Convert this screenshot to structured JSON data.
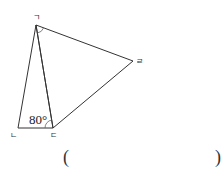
{
  "figure": {
    "vertices": {
      "giyeok": {
        "label": "ㄱ",
        "x": 36,
        "y": 25
      },
      "nieun": {
        "label": "ㄴ",
        "x": 18,
        "y": 128
      },
      "digeut": {
        "label": "ㄷ",
        "x": 53,
        "y": 128
      },
      "rieul": {
        "label": "ㄹ",
        "x": 133,
        "y": 61
      }
    },
    "angle_label": "80°",
    "marked_angles": [
      "angle at ㄱ (ㄷㄱㄹ)",
      "angle at ㄷ (ㄱㄷㄴ)"
    ]
  },
  "answer": {
    "open_paren": "(",
    "close_paren": ")",
    "value": ""
  }
}
